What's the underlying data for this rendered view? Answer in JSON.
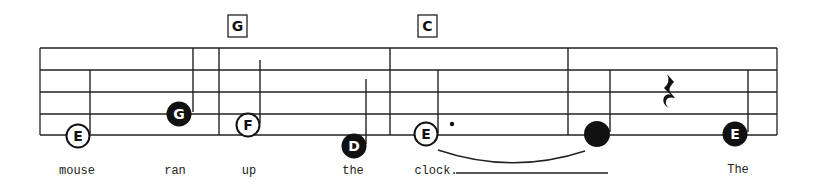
{
  "score": {
    "staff": {
      "x_start": 40,
      "x_end": 777,
      "line_y": [
        48,
        70,
        92,
        114,
        135
      ],
      "color": "#222222"
    },
    "barlines_x": [
      219,
      390,
      568
    ],
    "chords": [
      {
        "label": "G",
        "x": 237
      },
      {
        "label": "C",
        "x": 418
      }
    ],
    "notes": [
      {
        "letter": "E",
        "filled": false,
        "x": 78,
        "y": 136
      },
      {
        "letter": "G",
        "filled": true,
        "x": 178,
        "y": 114
      },
      {
        "letter": "F",
        "filled": false,
        "x": 248,
        "y": 125
      },
      {
        "letter": "D",
        "filled": true,
        "x": 355,
        "y": 146
      },
      {
        "letter": "E",
        "filled": false,
        "x": 426,
        "y": 135,
        "dotted": true
      },
      {
        "letter": "",
        "filled": true,
        "x": 597,
        "y": 134
      },
      {
        "letter": "E",
        "filled": true,
        "x": 735,
        "y": 134
      }
    ],
    "rest": {
      "type": "quarter-rest",
      "x": 669,
      "y": 92
    },
    "lyrics": [
      {
        "text": "mouse",
        "x": 77
      },
      {
        "text": "ran",
        "x": 175
      },
      {
        "text": "up",
        "x": 249
      },
      {
        "text": "the",
        "x": 353
      },
      {
        "text": "clock.",
        "x": 440
      },
      {
        "text": "The",
        "x": 738
      }
    ],
    "extender": {
      "x1": 456,
      "x2": 608
    }
  }
}
